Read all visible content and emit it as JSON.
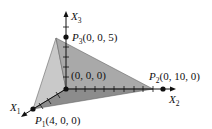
{
  "diagram": {
    "type": "3d-coordinate-tetrahedron",
    "axes": [
      {
        "name": "X",
        "sub": "1"
      },
      {
        "name": "X",
        "sub": "2"
      },
      {
        "name": "X",
        "sub": "3"
      }
    ],
    "points": [
      {
        "name": "P",
        "sub": "1",
        "coords": "(4, 0, 0)"
      },
      {
        "name": "P",
        "sub": "2",
        "coords": "(0, 10, 0)"
      },
      {
        "name": "P",
        "sub": "3",
        "coords": "(0, 0, 5)"
      }
    ],
    "origin_label": "(0, 0, 0)",
    "colors": {
      "left_face": "#c9c9c9",
      "right_face": "#a9a9a9",
      "bottom_face": "#8c8c8c",
      "edge": "#555555",
      "axis": "#111111"
    }
  }
}
